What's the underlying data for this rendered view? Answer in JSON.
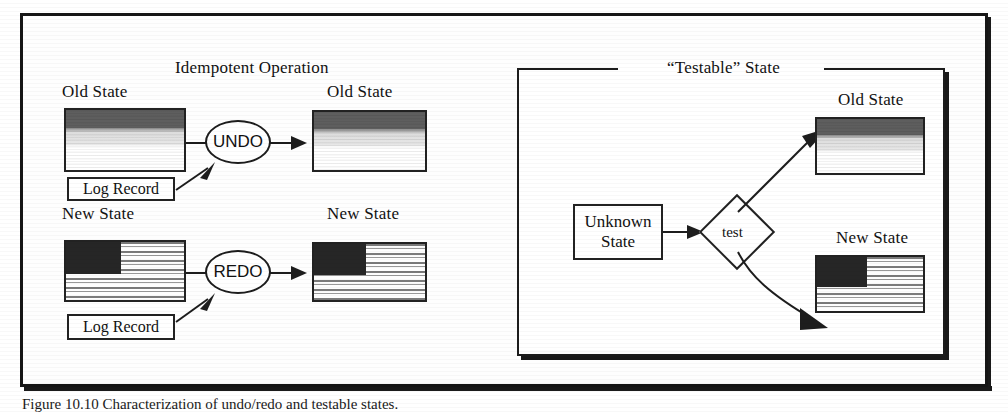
{
  "figure": {
    "caption": "Figure 10.10  Characterization of undo/redo and testable states.",
    "left_panel": {
      "title": "Idempotent Operation",
      "rows": [
        {
          "source_label": "Old State",
          "operation_label": "UNDO",
          "log_label": "Log Record",
          "result_label": "Old State",
          "source_fill": "banded-gradient",
          "result_fill": "banded-gradient"
        },
        {
          "source_label": "New State",
          "operation_label": "REDO",
          "log_label": "Log Record",
          "result_label": "New State",
          "source_fill": "text-lines-block",
          "result_fill": "text-lines-block"
        }
      ]
    },
    "right_panel": {
      "title": "“Testable” State",
      "source_label_line1": "Unknown",
      "source_label_line2": "State",
      "decision_label": "test",
      "outcome_top_label": "Old State",
      "outcome_bottom_label": "New State",
      "outcome_top_fill": "banded-gradient",
      "outcome_bottom_fill": "text-lines-block"
    }
  },
  "colors": {
    "ink": "#1a1a1a",
    "paper": "#ffffff",
    "band_dark": "#5e5e5e",
    "band_light": "#e2e2e2",
    "block_dark": "#262626"
  }
}
